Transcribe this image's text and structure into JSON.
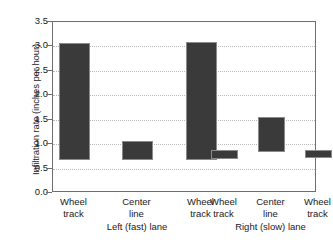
{
  "chart_data": {
    "type": "bar",
    "title": "",
    "subtitle": "",
    "xlabel": "",
    "ylabel": "Infiltration rate (inches per hour)",
    "ylim": [
      0.0,
      3.5
    ],
    "yticks": [
      "0.0",
      "0.5",
      "1.0",
      "1.5",
      "2.0",
      "2.5",
      "3.0",
      "3.5"
    ],
    "ytick_values": [
      0.0,
      0.5,
      1.0,
      1.5,
      2.0,
      2.5,
      3.0,
      3.5
    ],
    "grid": "horizontal dotted gridlines",
    "legend": "none",
    "bar_style": "floating range bars (min to max)",
    "categories": [
      "Wheel track",
      "Center line",
      "Wheel track",
      "Wheel track",
      "Center line",
      "Wheel track"
    ],
    "category_lines": [
      [
        "Wheel",
        "track"
      ],
      [
        "Center",
        "line"
      ],
      [
        "Wheel",
        "track"
      ],
      [
        "Wheel",
        "track"
      ],
      [
        "Center",
        "line"
      ],
      [
        "Wheel",
        "track"
      ]
    ],
    "groups": [
      {
        "label": "Left (fast) lane",
        "indices": [
          0,
          1,
          2
        ]
      },
      {
        "label": "Right (slow) lane",
        "indices": [
          3,
          4,
          5
        ]
      }
    ],
    "bars": [
      {
        "group": "Left (fast) lane",
        "category": "Wheel track",
        "low": 0.67,
        "high": 3.08
      },
      {
        "group": "Left (fast) lane",
        "category": "Center line",
        "low": 0.67,
        "high": 1.07
      },
      {
        "group": "Left (fast) lane",
        "category": "Wheel track",
        "low": 0.67,
        "high": 3.09
      },
      {
        "group": "Right (slow) lane",
        "category": "Wheel track",
        "low": 0.7,
        "high": 0.88
      },
      {
        "group": "Right (slow) lane",
        "category": "Center line",
        "low": 0.83,
        "high": 1.56
      },
      {
        "group": "Right (slow) lane",
        "category": "Wheel track",
        "low": 0.72,
        "high": 0.88
      }
    ],
    "values": [
      3.08,
      1.07,
      3.09,
      0.88,
      1.56,
      0.88
    ],
    "bar_color": "#3a3a3a",
    "frame_color": "#6e6e6e",
    "gridline_color": "#b9b9b9",
    "background": "#ffffff"
  }
}
